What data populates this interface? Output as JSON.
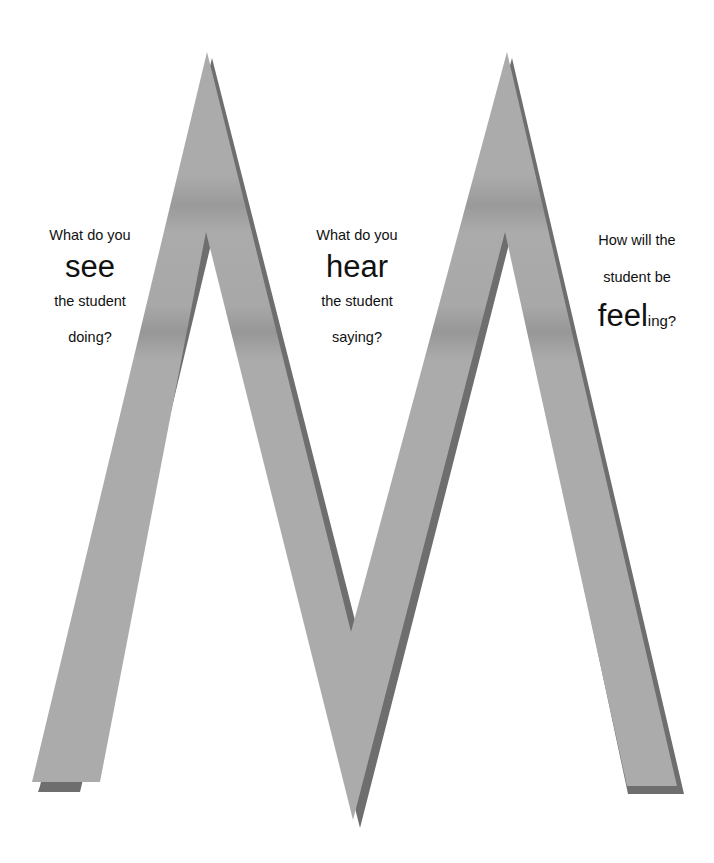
{
  "diagram": {
    "type": "M-shaped prompt diagram",
    "colors": {
      "shape_fill": "#ababab",
      "shape_shadow": "#6e6e6e",
      "band": "#999999",
      "background": "#ffffff",
      "text": "#111111"
    }
  },
  "prompts": {
    "see": {
      "line1": "What do you",
      "keyword": "see",
      "line2": "the student",
      "line3": "doing?"
    },
    "hear": {
      "line1": "What do you",
      "keyword": "hear",
      "line2": "the student",
      "line3": "saying?"
    },
    "feel": {
      "line1": "How will the",
      "line2": "student be",
      "keyword": "feel",
      "suffix": "ing?"
    }
  }
}
